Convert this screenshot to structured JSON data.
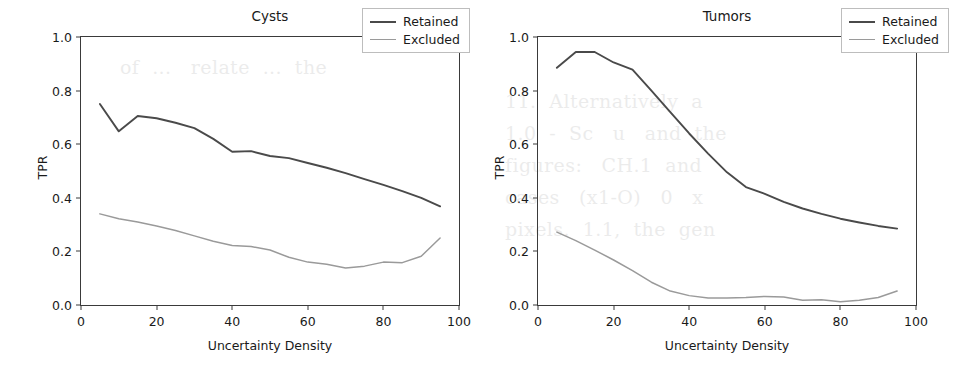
{
  "page": {
    "background_bleed_text": [
      "of  ...   relate  ...  the",
      "11.  Alternatively  a",
      "1.0  -  Sc   u   and  the",
      "figures:   CH.1  and",
      "cases   (x1-O)   0   x",
      "pixels.  1.1,  the  gen"
    ]
  },
  "figure": {
    "panels": [
      {
        "id": "cysts",
        "title": "Cysts",
        "xlabel": "Uncertainty Density",
        "ylabel": "TPR",
        "xticks": [
          "0",
          "20",
          "40",
          "60",
          "80",
          "100"
        ],
        "yticks": [
          "0.0",
          "0.2",
          "0.4",
          "0.6",
          "0.8",
          "1.0"
        ],
        "legend": {
          "position": "upper right",
          "entries": [
            {
              "label": "Retained",
              "color": "#4a4a4a"
            },
            {
              "label": "Excluded",
              "color": "#9a9a9a"
            }
          ]
        }
      },
      {
        "id": "tumors",
        "title": "Tumors",
        "xlabel": "Uncertainty Density",
        "ylabel": "TPR",
        "xticks": [
          "0",
          "20",
          "40",
          "60",
          "80",
          "100"
        ],
        "yticks": [
          "0.0",
          "0.2",
          "0.4",
          "0.6",
          "0.8",
          "1.0"
        ],
        "legend": {
          "position": "upper right",
          "entries": [
            {
              "label": "Retained",
              "color": "#4a4a4a"
            },
            {
              "label": "Excluded",
              "color": "#9a9a9a"
            }
          ]
        }
      }
    ]
  },
  "chart_data": [
    {
      "type": "line",
      "title": "Cysts",
      "xlabel": "Uncertainty Density",
      "ylabel": "TPR",
      "xlim": [
        0,
        100
      ],
      "ylim": [
        0.0,
        1.0
      ],
      "grid": false,
      "legend_position": "upper right",
      "x": [
        5,
        10,
        15,
        20,
        25,
        30,
        35,
        40,
        45,
        50,
        55,
        60,
        65,
        70,
        75,
        80,
        85,
        90,
        95
      ],
      "series": [
        {
          "name": "Retained",
          "color": "#4a4a4a",
          "values": [
            0.75,
            0.648,
            0.705,
            0.697,
            0.68,
            0.66,
            0.62,
            0.572,
            0.574,
            0.556,
            0.548,
            0.53,
            0.512,
            0.492,
            0.47,
            0.448,
            0.425,
            0.4,
            0.368
          ]
        },
        {
          "name": "Excluded",
          "color": "#9a9a9a",
          "values": [
            0.34,
            0.322,
            0.31,
            0.295,
            0.278,
            0.258,
            0.238,
            0.222,
            0.218,
            0.205,
            0.178,
            0.16,
            0.152,
            0.138,
            0.145,
            0.16,
            0.158,
            0.182,
            0.25
          ]
        }
      ]
    },
    {
      "type": "line",
      "title": "Tumors",
      "xlabel": "Uncertainty Density",
      "ylabel": "TPR",
      "xlim": [
        0,
        100
      ],
      "ylim": [
        0.0,
        1.0
      ],
      "grid": false,
      "legend_position": "upper right",
      "x": [
        5,
        10,
        15,
        20,
        25,
        30,
        35,
        40,
        45,
        50,
        55,
        60,
        65,
        70,
        75,
        80,
        85,
        90,
        95
      ],
      "series": [
        {
          "name": "Retained",
          "color": "#4a4a4a",
          "values": [
            0.885,
            0.944,
            0.944,
            0.905,
            0.878,
            0.8,
            0.72,
            0.64,
            0.565,
            0.495,
            0.44,
            0.415,
            0.385,
            0.36,
            0.34,
            0.322,
            0.308,
            0.295,
            0.285
          ]
        },
        {
          "name": "Excluded",
          "color": "#9a9a9a",
          "values": [
            0.272,
            0.24,
            0.205,
            0.168,
            0.128,
            0.085,
            0.052,
            0.035,
            0.026,
            0.026,
            0.028,
            0.032,
            0.03,
            0.018,
            0.02,
            0.012,
            0.018,
            0.028,
            0.052
          ]
        }
      ]
    }
  ]
}
